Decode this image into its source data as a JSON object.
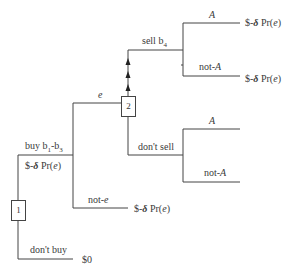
{
  "diagram": {
    "type": "decision-tree",
    "nodes": [
      {
        "id": "1",
        "label": "1",
        "kind": "decision"
      },
      {
        "id": "2",
        "label": "2",
        "kind": "decision"
      }
    ],
    "branches": {
      "buy": "buy b1-b3",
      "buy_sub1": "1",
      "buy_sub3": "3",
      "buy_prefix": "buy b",
      "buy_mid": "-b",
      "buy_payoff_prefix": "$-",
      "dont_buy": "don't buy",
      "e": "e",
      "not_e": "not-",
      "not_e_var": "e",
      "sell": "sell b",
      "sell_sub": "4",
      "dont_sell": "don't sell",
      "A": "A",
      "not_A_prefix": "not-",
      "not_A_var": "A"
    },
    "payoffs": {
      "dollar_minus": "$-",
      "delta": "δ",
      "pr_open": " Pr(",
      "e": "e",
      "close": ")",
      "zero": "$0"
    }
  }
}
